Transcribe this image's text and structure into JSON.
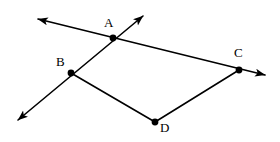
{
  "figure": {
    "background_color": "#ffffff",
    "stroke_color": "#000000",
    "label_color": "#000000",
    "stroke_width": 1.6,
    "dot_radius": 3.4,
    "width": 280,
    "height": 142
  },
  "points": [
    {
      "id": "A",
      "label": "A",
      "x": 113,
      "y": 38,
      "label_x": 104,
      "label_y": 16
    },
    {
      "id": "B",
      "label": "B",
      "x": 71,
      "y": 73,
      "label_x": 56,
      "label_y": 55
    },
    {
      "id": "C",
      "label": "C",
      "x": 239,
      "y": 70,
      "label_x": 234,
      "label_y": 46
    },
    {
      "id": "D",
      "label": "D",
      "x": 155,
      "y": 122,
      "label_x": 160,
      "label_y": 121
    }
  ],
  "segments": [
    {
      "id": "ray-left-through-A-to-C",
      "from": [
        38,
        19
      ],
      "to": [
        265,
        75
      ],
      "arrow_start": true,
      "arrow_end": true
    },
    {
      "id": "ray-upper-right-through-A-and-B",
      "from": [
        143,
        16
      ],
      "to": [
        18,
        120
      ],
      "arrow_start": true,
      "arrow_end": true
    },
    {
      "id": "segment-B-to-D",
      "from": [
        71,
        73
      ],
      "to": [
        155,
        122
      ],
      "arrow_start": false,
      "arrow_end": false
    },
    {
      "id": "segment-D-to-C",
      "from": [
        155,
        122
      ],
      "to": [
        239,
        70
      ],
      "arrow_start": false,
      "arrow_end": false
    }
  ],
  "arrowheads": [
    {
      "id": "arrow-upper-left",
      "tip_x": 38,
      "tip_y": 19
    },
    {
      "id": "arrow-upper-right",
      "tip_x": 143,
      "tip_y": 16
    },
    {
      "id": "arrow-lower-left",
      "tip_x": 18,
      "tip_y": 120
    },
    {
      "id": "arrow-right",
      "tip_x": 265,
      "tip_y": 75
    }
  ]
}
